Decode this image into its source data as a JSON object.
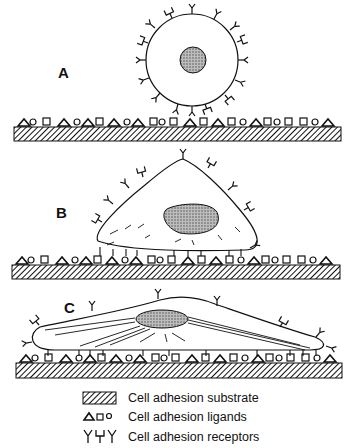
{
  "panels": [
    {
      "label": "A",
      "state": "rounded cell, not attached"
    },
    {
      "label": "B",
      "state": "cell spreading, partial attachment"
    },
    {
      "label": "C",
      "state": "flattened cell, fully spread with stress fibers"
    }
  ],
  "legend": {
    "substrate": "Cell adhesion substrate",
    "ligands": "Cell adhesion ligands",
    "receptors": "Cell adhesion receptors",
    "ligand_symbols": "△□○",
    "receptor_symbols": "Y⊔Y"
  },
  "colors": {
    "ink": "#111111",
    "nucleus": "#9a9a9a",
    "background": "#ffffff"
  }
}
